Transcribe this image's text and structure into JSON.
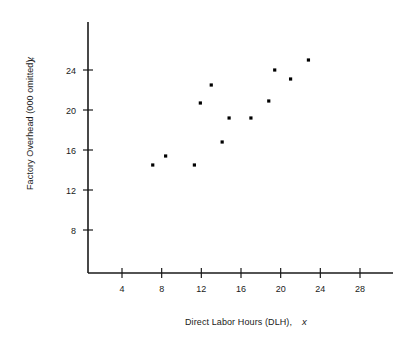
{
  "chart_data": {
    "type": "scatter",
    "title": "",
    "xlabel": "Direct Labor Hours (DLH),",
    "xlabel_var": "x",
    "ylabel": "Factory Overhead (000 omitted),",
    "ylabel_var": "y",
    "xticks": [
      4,
      8,
      12,
      16,
      20,
      24,
      28
    ],
    "yticks": [
      8,
      12,
      16,
      20,
      24
    ],
    "xlim": [
      0,
      32
    ],
    "ylim": [
      0,
      28
    ],
    "grid": false,
    "legend": null,
    "marker": "square",
    "marker_color": "#000000",
    "points": [
      {
        "x": 7.1,
        "y": 14.5
      },
      {
        "x": 8.4,
        "y": 15.4
      },
      {
        "x": 11.3,
        "y": 14.5
      },
      {
        "x": 11.9,
        "y": 20.7
      },
      {
        "x": 13.0,
        "y": 22.5
      },
      {
        "x": 14.1,
        "y": 16.8
      },
      {
        "x": 14.8,
        "y": 19.2
      },
      {
        "x": 17.0,
        "y": 19.2
      },
      {
        "x": 18.8,
        "y": 20.9
      },
      {
        "x": 19.4,
        "y": 24.0
      },
      {
        "x": 21.0,
        "y": 23.1
      },
      {
        "x": 22.8,
        "y": 25.0
      }
    ]
  },
  "axes": {
    "x_axis_name": "x-axis",
    "y_axis_name": "y-axis"
  }
}
